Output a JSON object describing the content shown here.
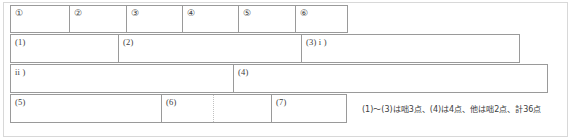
{
  "sheet": {
    "title": "answer-sheet",
    "rows": [
      {
        "id": "row-circled",
        "cells": [
          {
            "label": "①"
          },
          {
            "label": "②"
          },
          {
            "label": "③"
          },
          {
            "label": "④"
          },
          {
            "label": "⑤"
          },
          {
            "label": "⑥"
          }
        ]
      },
      {
        "id": "row-1-2-3",
        "cells": [
          {
            "label": "(1)"
          },
          {
            "label": "(2)"
          },
          {
            "label": "(3) i )"
          }
        ]
      },
      {
        "id": "row-ii-4",
        "cells": [
          {
            "label": "ii )"
          },
          {
            "label": "(4)"
          }
        ]
      },
      {
        "id": "row-5-6-7",
        "cells": [
          {
            "label": "(5)"
          },
          {
            "label": "(6)"
          },
          {
            "label": ""
          },
          {
            "label": "(7)"
          }
        ]
      }
    ],
    "score_note": "(1)～(3)は咄3点、(4)は4点、他は咄2点、計36点"
  }
}
